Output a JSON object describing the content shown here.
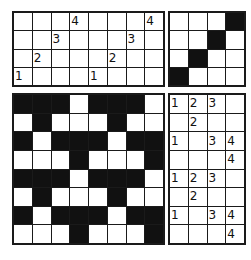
{
  "figure": {
    "kind": "nonogram-puzzle-figure",
    "background_color": "#ffffff",
    "line_color": "#111111",
    "filled_color": "#111111",
    "empty_color": "#ffffff"
  },
  "panels": {
    "clue_grid_top_left": {
      "name": "clue-grid-top-left",
      "columns": 8,
      "rows": 4,
      "cells": [
        [
          "",
          "",
          "",
          "4",
          "",
          "",
          "",
          "4"
        ],
        [
          "",
          "",
          "3",
          "",
          "",
          "",
          "3",
          ""
        ],
        [
          "",
          "2",
          "",
          "",
          "",
          "2",
          "",
          ""
        ],
        [
          "1",
          "",
          "",
          "",
          "1",
          "",
          "",
          ""
        ]
      ]
    },
    "pattern_grid_top_right": {
      "name": "pattern-grid-top-right",
      "columns": 4,
      "rows": 4,
      "cells": [
        [
          0,
          0,
          0,
          1
        ],
        [
          0,
          0,
          1,
          0
        ],
        [
          0,
          1,
          0,
          0
        ],
        [
          1,
          0,
          0,
          0
        ]
      ]
    },
    "pattern_grid_bottom_left": {
      "name": "pattern-grid-bottom-left",
      "columns": 8,
      "rows": 8,
      "cells": [
        [
          1,
          1,
          1,
          0,
          1,
          1,
          1,
          0
        ],
        [
          0,
          1,
          0,
          0,
          0,
          1,
          0,
          0
        ],
        [
          1,
          0,
          1,
          1,
          1,
          0,
          1,
          1
        ],
        [
          0,
          0,
          0,
          1,
          0,
          0,
          0,
          1
        ],
        [
          1,
          1,
          1,
          0,
          1,
          1,
          1,
          0
        ],
        [
          0,
          1,
          0,
          0,
          0,
          1,
          0,
          0
        ],
        [
          1,
          0,
          1,
          1,
          1,
          0,
          1,
          1
        ],
        [
          0,
          0,
          0,
          1,
          0,
          0,
          0,
          1
        ]
      ]
    },
    "clue_grid_bottom_right": {
      "name": "clue-grid-bottom-right",
      "columns": 4,
      "rows": 8,
      "cells": [
        [
          "1",
          "2",
          "3",
          ""
        ],
        [
          "",
          "2",
          "",
          ""
        ],
        [
          "1",
          "",
          "3",
          "4"
        ],
        [
          "",
          "",
          "",
          "4"
        ],
        [
          "1",
          "2",
          "3",
          ""
        ],
        [
          "",
          "2",
          "",
          ""
        ],
        [
          "1",
          "",
          "3",
          "4"
        ],
        [
          "",
          "",
          "",
          "4"
        ]
      ]
    }
  }
}
